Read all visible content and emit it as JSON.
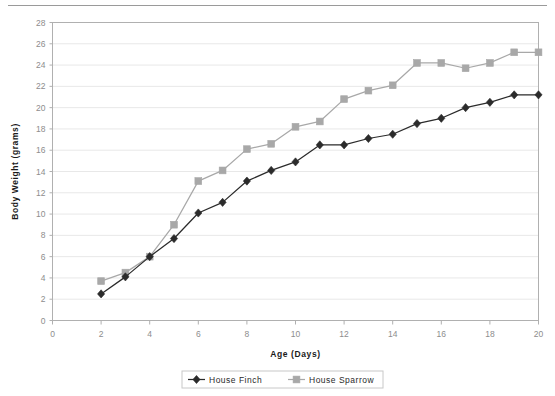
{
  "chart_data": {
    "type": "line",
    "title": "",
    "xlabel": "Age  (Days)",
    "ylabel": "Body Weight  (grams)",
    "xlim": [
      0,
      20
    ],
    "ylim": [
      0,
      28
    ],
    "xticks": [
      0,
      2,
      4,
      6,
      8,
      10,
      12,
      14,
      16,
      18,
      20
    ],
    "yticks": [
      0,
      2,
      4,
      6,
      8,
      10,
      12,
      14,
      16,
      18,
      20,
      22,
      24,
      26,
      28
    ],
    "grid": "horizontal",
    "legend_position": "bottom-center",
    "x": [
      2,
      3,
      4,
      5,
      6,
      7,
      8,
      9,
      10,
      11,
      12,
      13,
      14,
      15,
      16,
      17,
      18,
      19,
      20
    ],
    "series": [
      {
        "name": "House Finch",
        "color": "#2b2b2b",
        "marker": "diamond",
        "values": [
          2.5,
          4.1,
          6.0,
          7.7,
          10.1,
          11.1,
          13.1,
          14.1,
          14.9,
          16.5,
          16.5,
          17.1,
          17.5,
          18.5,
          19.0,
          20.0,
          20.5,
          21.2,
          21.2
        ]
      },
      {
        "name": "House Sparrow",
        "color": "#a8a8a8",
        "marker": "square",
        "values": [
          3.7,
          4.5,
          6.0,
          9.0,
          13.1,
          14.1,
          16.1,
          16.6,
          18.2,
          18.7,
          20.8,
          21.6,
          22.1,
          24.2,
          24.2,
          23.7,
          24.2,
          25.2,
          25.2
        ]
      }
    ]
  },
  "legend": {
    "items": [
      {
        "label": "House Finch"
      },
      {
        "label": "House Sparrow"
      }
    ]
  },
  "colors": {
    "finch": "#2b2b2b",
    "sparrow": "#a8a8a8",
    "grid": "#e8e8e8",
    "axis": "#b0b0b0",
    "tick_text": "#8d8d8d",
    "title_text": "#1a1a1a"
  }
}
